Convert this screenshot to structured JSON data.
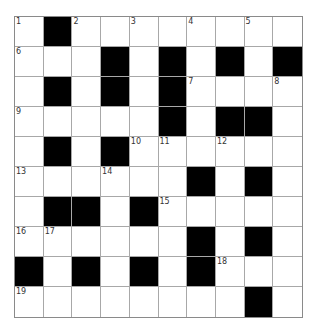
{
  "puzzle": {
    "rows": 10,
    "cols": 10,
    "colors": {
      "block": "#000000",
      "cell": "#ffffff",
      "gridline": "#a8a8a8"
    },
    "grid": [
      [
        "1",
        "#",
        "2",
        "",
        "3",
        "",
        "4",
        "",
        "5",
        ""
      ],
      [
        "6",
        "",
        "",
        "#",
        "",
        "#",
        "",
        "#",
        "",
        "#"
      ],
      [
        "",
        "#",
        "",
        "#",
        "",
        "#",
        "7",
        "",
        "",
        "8"
      ],
      [
        "9",
        "",
        "",
        "",
        "",
        "#",
        "",
        "#",
        "#",
        ""
      ],
      [
        "",
        "#",
        "",
        "#",
        "10",
        "11",
        "",
        "12",
        "",
        ""
      ],
      [
        "13",
        "",
        "",
        "14",
        "",
        "",
        "#",
        "",
        "#",
        ""
      ],
      [
        "",
        "#",
        "#",
        "",
        "#",
        "15",
        "",
        "",
        "",
        ""
      ],
      [
        "16",
        "17",
        "",
        "",
        "",
        "",
        "#",
        "",
        "#",
        ""
      ],
      [
        "#",
        "",
        "#",
        "",
        "#",
        "",
        "#",
        "18",
        "",
        ""
      ],
      [
        "19",
        "",
        "",
        "",
        "",
        "",
        "",
        "",
        "#",
        ""
      ]
    ]
  }
}
